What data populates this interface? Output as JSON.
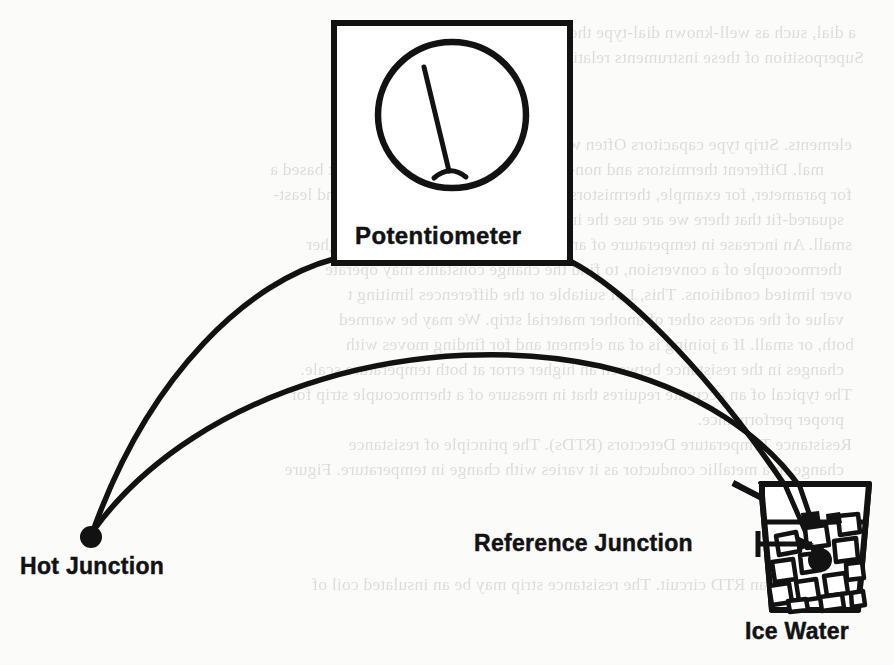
{
  "figure": {
    "kind": "thermocouple-circuit-diagram",
    "labels": {
      "potentiometer": "Potentiometer",
      "hot_junction": "Hot Junction",
      "reference_junction": "Reference Junction",
      "ice_water": "Ice Water"
    },
    "ink_color": "#121212",
    "paper_color": "#fbfbfa",
    "components": {
      "potentiometer_box": "rectangular instrument case",
      "meter_dial": "round analog gauge with pointer needle",
      "wire_upper": "thermocouple lead from left box terminal to hot junction",
      "wire_lower": "thermocouple lead from right box terminal to reference junction",
      "hot_junction_dot": "filled circle weld bead",
      "reference_junction_dot": "filled circle weld bead immersed in ice bath",
      "beaker": "glass beaker with pouring spout",
      "water_line": "liquid surface line",
      "ice_cubes_count": 13,
      "callout_arrow": "arrow from Reference Junction label to junction dot"
    }
  },
  "bleed_through": {
    "note": "faint mirrored text showing through from the reverse side of the scanned page",
    "lines": [
      "a dial, such as well-known dial-type thermometers use or to type",
      "Superposition of these instruments relative to each   on   value of the equa",
      "elements.  Strip type  capacitors  Often we desire having  invariant ther-",
      "mal.   Different thermistors and non-linearity factor.  In certain  venient based a",
      "for parameter, for example, thermistors for coefficient of ratio reading and least-",
      "squared-fit   that there   we   are   use the   in sufficient only of another",
      "small.  An increase in temperature of any of these  factors  which has a higher",
      "thermocouple   of a conversion, to find  the  change  constants  may operate",
      "over limited conditions.   This, I  of suitable   or   the  differences limiting  t",
      "value of the   across other of another   material  strip.  We may be warmed",
      "both, or small.   If a joining is of an element and for finding   moves with",
      "changes in the resistance between an higher error  at both temperature scale.",
      "The typical of an accurate requires that in measure   of a thermocouple strip for",
      "proper performance.",
      "Resistance Temperature Detectors (RTDs).   The principle of resistance",
      "change in a metallic conductor as it varies with change in temperature.  Figure",
      "7.24 shows an RTD circuit.  The resistance strip may be an insulated coil of"
    ]
  }
}
